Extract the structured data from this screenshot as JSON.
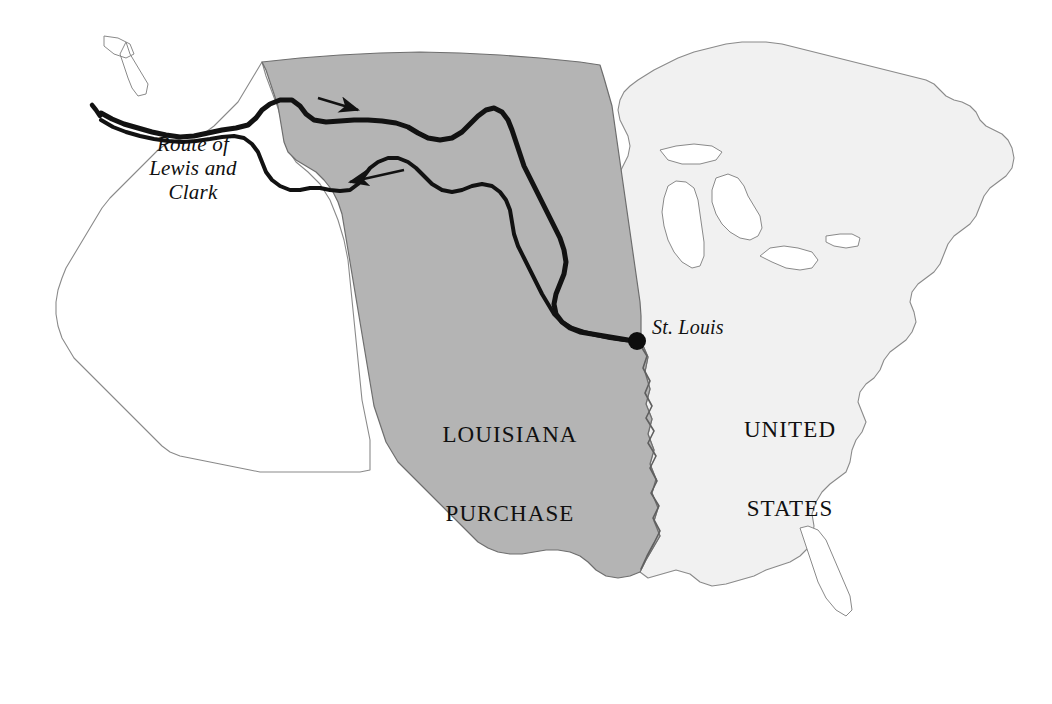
{
  "figure": {
    "kind": "historical-map",
    "width": 1052,
    "height": 704,
    "background_color": "#ffffff"
  },
  "regions": [
    {
      "id": "louisiana-purchase",
      "label_line1": "LOUISIANA",
      "label_line2": "PURCHASE",
      "fill_color": "#b4b4b4",
      "stroke_color": "#6e6e6e"
    },
    {
      "id": "united-states",
      "label_line1": "UNITED",
      "label_line2": "STATES",
      "fill_color": "#f1f1f1",
      "stroke_color": "#8a8a8a"
    },
    {
      "id": "unclaimed-west",
      "label_line1": "",
      "label_line2": "",
      "fill_color": "#ffffff",
      "stroke_color": "#8a8a8a"
    }
  ],
  "labels": {
    "route": "Route of\nLewis and\nClark",
    "st_louis": "St. Louis",
    "louisiana_purchase_line1": "LOUISIANA",
    "louisiana_purchase_line2": "PURCHASE",
    "united_states_line1": "UNITED",
    "united_states_line2": "STATES"
  },
  "markers": [
    {
      "name": "st-louis-dot",
      "x": 637,
      "y": 341,
      "radius": 9,
      "color": "#0d0d0d"
    }
  ],
  "route": {
    "name": "Route of Lewis and Clark",
    "style": "double-line",
    "color": "#121212",
    "direction_arrows": [
      {
        "name": "outbound-arrow-east",
        "direction": "east",
        "x": 345,
        "y": 105
      },
      {
        "name": "return-arrow-west",
        "direction": "west",
        "x": 372,
        "y": 178
      }
    ]
  },
  "colors": {
    "purchase_fill": "#b4b4b4",
    "us_fill": "#f1f1f1",
    "west_fill": "#ffffff",
    "coast_stroke": "#8a8a8a",
    "purchase_stroke": "#6e6e6e",
    "route_stroke": "#121212",
    "text": "#101010"
  }
}
